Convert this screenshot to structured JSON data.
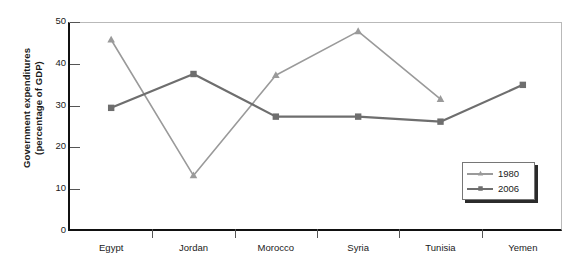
{
  "chart_data": {
    "type": "line",
    "title": "",
    "xlabel": "",
    "ylabel": "Government expenditures (percentage of GDP)",
    "ylabel_line1": "Government expenditures",
    "ylabel_line2": "(percentage of GDP)",
    "categories": [
      "Egypt",
      "Jordan",
      "Morocco",
      "Syria",
      "Tunisia",
      "Yemen"
    ],
    "ylim": [
      0,
      50
    ],
    "yticks": [
      0,
      10,
      20,
      30,
      40,
      50
    ],
    "grid": false,
    "legend_position": "inside-bottom-right",
    "series": [
      {
        "name": "1980",
        "color": "#9a9a9a",
        "marker": "triangle",
        "values": [
          46.0,
          13.5,
          37.5,
          48.0,
          31.8,
          null
        ]
      },
      {
        "name": "2006",
        "color": "#6e6e6e",
        "marker": "square",
        "values": [
          29.7,
          37.8,
          27.6,
          27.6,
          26.4,
          35.2
        ]
      }
    ]
  },
  "legend": {
    "items": [
      {
        "label": "1980"
      },
      {
        "label": "2006"
      }
    ]
  },
  "colors": {
    "series_1980": "#9a9a9a",
    "series_2006": "#6e6e6e",
    "axis": "#111111",
    "frame_light": "#b9b9b9",
    "background": "#ffffff"
  }
}
